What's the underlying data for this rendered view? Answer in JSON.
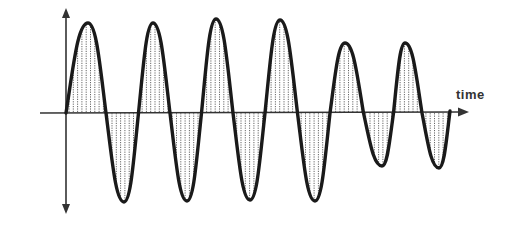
{
  "diagram": {
    "title": "",
    "axis_label_time": "time",
    "axis": {
      "origin": [
        66,
        113
      ],
      "vertical_top": 10,
      "vertical_bottom": 212,
      "horizontal_left": 40,
      "horizontal_right": 468
    },
    "waveform": {
      "description": "Sine wave oscillation with shaded (hatched) areas between curve and time axis; last two cycles have reduced amplitude",
      "start": [
        66,
        113
      ],
      "extrema": [
        [
          88,
          23
        ],
        [
          124,
          202
        ],
        [
          153,
          23
        ],
        [
          187,
          201
        ],
        [
          216,
          19
        ],
        [
          250,
          200
        ],
        [
          280,
          20
        ],
        [
          315,
          201
        ],
        [
          345,
          43
        ],
        [
          382,
          166
        ],
        [
          405,
          43
        ],
        [
          439,
          168
        ]
      ],
      "end": [
        450,
        111
      ]
    },
    "colors": {
      "wave": "#1a1a1a",
      "axis": "#333333",
      "hatch": "#555555",
      "background": "#ffffff"
    }
  }
}
